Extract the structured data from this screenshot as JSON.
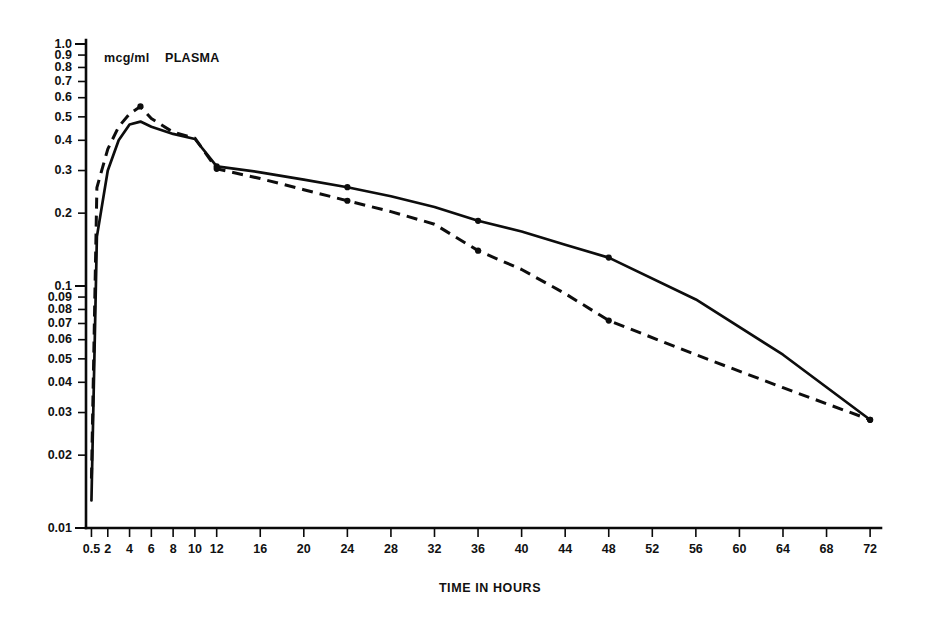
{
  "chart_data": {
    "type": "line",
    "title": "",
    "subtitle": "",
    "unit_label": "mcg/ml",
    "panel_label": "PLASMA",
    "xlabel": "TIME IN HOURS",
    "ylabel": "",
    "yscale": "log",
    "xscale": "linear",
    "grid": false,
    "legend_position": "none",
    "xlim": [
      0,
      73
    ],
    "ylim": [
      0.01,
      1.0
    ],
    "x_tick_labels": [
      "0.5",
      "2",
      "4",
      "6",
      "8",
      "10",
      "12",
      "16",
      "20",
      "24",
      "28",
      "32",
      "36",
      "40",
      "44",
      "48",
      "52",
      "56",
      "60",
      "64",
      "68",
      "72"
    ],
    "x_tick_values": [
      0.5,
      2,
      4,
      6,
      8,
      10,
      12,
      16,
      20,
      24,
      28,
      32,
      36,
      40,
      44,
      48,
      52,
      56,
      60,
      64,
      68,
      72
    ],
    "y_tick_labels": [
      "1.0",
      "0.9",
      "0.8",
      "0.7",
      "0.6",
      "0.5",
      "0.4",
      "0.3",
      "0.2",
      "0.1",
      "0.09",
      "0.08",
      "0.07",
      "0.06",
      "0.05",
      "0.04",
      "0.03",
      "0.02",
      "0.01"
    ],
    "y_tick_values": [
      1.0,
      0.9,
      0.8,
      0.7,
      0.6,
      0.5,
      0.4,
      0.3,
      0.2,
      0.1,
      0.09,
      0.08,
      0.07,
      0.06,
      0.05,
      0.04,
      0.03,
      0.02,
      0.01
    ],
    "x": [
      0.5,
      1,
      2,
      3,
      4,
      5,
      6,
      8,
      10,
      12,
      16,
      20,
      24,
      28,
      32,
      36,
      40,
      44,
      48,
      56,
      64,
      72
    ],
    "series": [
      {
        "name": "solid-curve",
        "style": "solid",
        "color": "#0d0d0d",
        "values": [
          0.013,
          0.16,
          0.3,
          0.4,
          0.465,
          0.478,
          0.455,
          0.425,
          0.405,
          0.312,
          0.295,
          0.275,
          0.256,
          0.235,
          0.212,
          0.186,
          0.168,
          0.148,
          0.131,
          0.088,
          0.052,
          0.028
        ],
        "marker_x": [
          12,
          24,
          36,
          48,
          72
        ],
        "marker_values": [
          0.312,
          0.256,
          0.186,
          0.131,
          0.028
        ]
      },
      {
        "name": "dashed-curve",
        "style": "dashed",
        "color": "#0d0d0d",
        "values": [
          0.016,
          0.255,
          0.368,
          0.455,
          0.515,
          0.552,
          0.492,
          0.432,
          0.408,
          0.305,
          0.278,
          0.25,
          0.225,
          0.203,
          0.18,
          0.14,
          0.117,
          0.093,
          0.072,
          0.052,
          0.038,
          0.028
        ],
        "marker_x": [
          5,
          12,
          24,
          36,
          48,
          72
        ],
        "marker_values": [
          0.552,
          0.305,
          0.225,
          0.14,
          0.072,
          0.028
        ]
      }
    ]
  }
}
